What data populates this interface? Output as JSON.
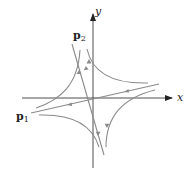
{
  "diagram": {
    "type": "phase-portrait-saddle",
    "axes": {
      "x_label": "x",
      "y_label": "y"
    },
    "eigenvectors": [
      {
        "label_main": "p",
        "label_sub": "1"
      },
      {
        "label_main": "p",
        "label_sub": "2"
      }
    ],
    "colors": {
      "axis": "#222222",
      "trajectory": "#8a8a8a"
    }
  }
}
